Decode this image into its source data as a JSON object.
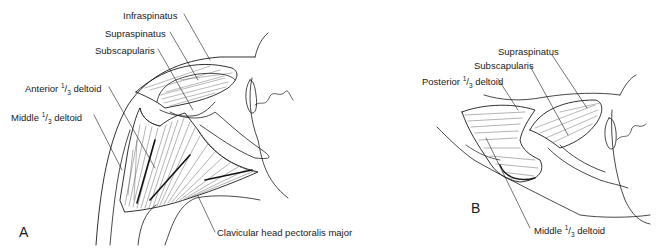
{
  "figure": {
    "panels": [
      {
        "id": "A",
        "letter": "A",
        "view": "anterior shoulder",
        "labels": {
          "infraspinatus": "Infraspinatus",
          "supraspinatus": "Supraspinatus",
          "subscapularis": "Subscapularis",
          "anterior_deltoid_pre": "Anterior ",
          "anterior_deltoid_frac_num": "1",
          "anterior_deltoid_frac_den": "3",
          "anterior_deltoid_post": " deltoid",
          "middle_deltoid_pre": "Middle ",
          "middle_deltoid_frac_num": "1",
          "middle_deltoid_frac_den": "3",
          "middle_deltoid_post": " deltoid",
          "pectoralis": "Clavicular head pectoralis major"
        }
      },
      {
        "id": "B",
        "letter": "B",
        "view": "posterior/lateral shoulder",
        "labels": {
          "supraspinatus": "Supraspinatus",
          "subscapularis": "Subscapularis",
          "posterior_deltoid_pre": "Posterior ",
          "posterior_deltoid_frac_num": "1",
          "posterior_deltoid_frac_den": "3",
          "posterior_deltoid_post": " deltoid",
          "middle_deltoid_pre": "Middle ",
          "middle_deltoid_frac_num": "1",
          "middle_deltoid_frac_den": "3",
          "middle_deltoid_post": " deltoid"
        }
      }
    ],
    "colors": {
      "ink": "#1a1a1a",
      "background": "#ffffff"
    }
  }
}
